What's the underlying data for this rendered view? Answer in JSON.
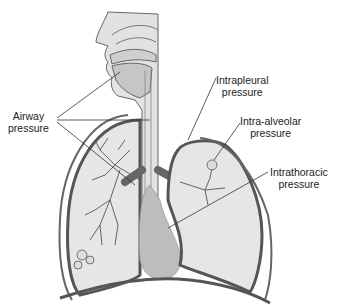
{
  "diagram": {
    "labels": {
      "airway": {
        "line1": "Airway",
        "line2": "pressure"
      },
      "intrapleural": {
        "line1": "Intrapleural",
        "line2": "pressure"
      },
      "intra_alveolar": {
        "line1": "Intra-alveolar",
        "line2": "pressure"
      },
      "intrathoracic": {
        "line1": "Intrathoracic",
        "line2": "pressure"
      }
    },
    "colors": {
      "tissue_fill": "#d9d9d9",
      "lung_fill": "#e6e6e6",
      "heart_fill": "#bdbdbd",
      "outline": "#555555",
      "pleura": "#6b6b6b",
      "leader_line": "#333333"
    }
  }
}
